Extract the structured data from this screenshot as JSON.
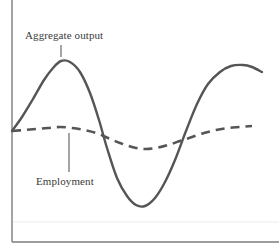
{
  "figure": {
    "background_color": "#ffffff",
    "width": 279,
    "height": 248
  },
  "axes": {
    "color": "#7d7d80",
    "y_axis": {
      "x": 12,
      "y_top": 0,
      "y_bottom": 242
    },
    "x_axis": {
      "y": 242,
      "x_left": 12,
      "x_right": 279
    },
    "baseline_guide": {
      "y": 222,
      "color": "#ececec"
    }
  },
  "labels": {
    "aggregate_output": "Aggregate output",
    "employment": "Employment"
  },
  "leader_lines": {
    "aggregate_output": {
      "x": 61,
      "y_top": 45,
      "y_bottom": 57
    },
    "employment": {
      "x": 69,
      "y_top": 133,
      "y_bottom": 172
    }
  },
  "chart_data": {
    "type": "line",
    "title": "",
    "xlabel": "",
    "ylabel": "",
    "grid": false,
    "legend": "inline-annotations",
    "xlim": [
      0,
      279
    ],
    "ylim": [
      248,
      0
    ],
    "note": "Business cycle schematic: aggregate output fluctuates with large amplitude while employment varies with much smaller amplitude around the same starting level.",
    "series": [
      {
        "name": "Aggregate output",
        "style": "solid",
        "color": "#555558",
        "width": 2.4,
        "points": [
          [
            12,
            131
          ],
          [
            22,
            117
          ],
          [
            33,
            99
          ],
          [
            44,
            80
          ],
          [
            53,
            68
          ],
          [
            61,
            61
          ],
          [
            70,
            62
          ],
          [
            80,
            72
          ],
          [
            90,
            93
          ],
          [
            99,
            120
          ],
          [
            107,
            148
          ],
          [
            117,
            178
          ],
          [
            127,
            196
          ],
          [
            136,
            205
          ],
          [
            145,
            206
          ],
          [
            155,
            198
          ],
          [
            165,
            182
          ],
          [
            175,
            160
          ],
          [
            186,
            131
          ],
          [
            197,
            104
          ],
          [
            208,
            84
          ],
          [
            220,
            72
          ],
          [
            231,
            66
          ],
          [
            243,
            65
          ],
          [
            252,
            67
          ],
          [
            262,
            72
          ]
        ]
      },
      {
        "name": "Employment",
        "style": "dashed",
        "color": "#555558",
        "width": 2.6,
        "dash_pattern": "9 6",
        "points": [
          [
            12,
            131
          ],
          [
            24,
            130
          ],
          [
            36,
            129
          ],
          [
            48,
            128
          ],
          [
            60,
            127
          ],
          [
            72,
            128
          ],
          [
            84,
            130
          ],
          [
            96,
            133
          ],
          [
            108,
            138
          ],
          [
            120,
            143
          ],
          [
            132,
            147
          ],
          [
            144,
            149
          ],
          [
            156,
            148
          ],
          [
            168,
            145
          ],
          [
            180,
            141
          ],
          [
            192,
            137
          ],
          [
            204,
            133
          ],
          [
            216,
            130
          ],
          [
            228,
            128
          ],
          [
            240,
            127
          ],
          [
            252,
            126
          ]
        ]
      }
    ]
  }
}
